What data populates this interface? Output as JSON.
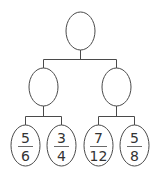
{
  "diagram": {
    "type": "fraction-tree",
    "root": {
      "label": ""
    },
    "middle": [
      {
        "label": ""
      },
      {
        "label": ""
      }
    ],
    "leaves": [
      {
        "numerator": "5",
        "denominator": "6"
      },
      {
        "numerator": "3",
        "denominator": "4"
      },
      {
        "numerator": "7",
        "denominator": "12"
      },
      {
        "numerator": "5",
        "denominator": "8"
      }
    ]
  }
}
